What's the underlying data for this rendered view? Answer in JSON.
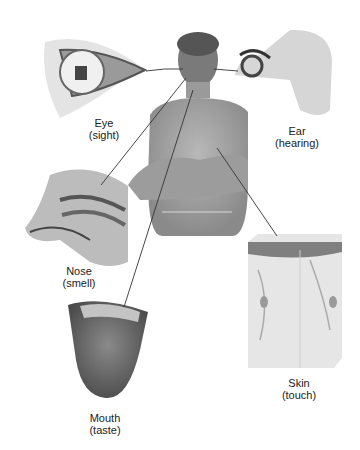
{
  "diagram": {
    "organs": [
      {
        "name": "Eye",
        "sense": "(sight)"
      },
      {
        "name": "Ear",
        "sense": "(hearing)"
      },
      {
        "name": "Nose",
        "sense": "(smell)"
      },
      {
        "name": "Mouth",
        "sense": "(taste)"
      },
      {
        "name": "Skin",
        "sense": "(touch)"
      }
    ]
  }
}
